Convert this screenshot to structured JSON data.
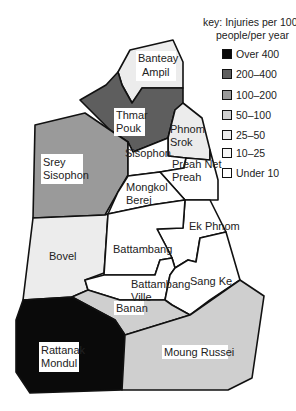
{
  "key": {
    "title_line1": "key: Injuries per 100,000",
    "title_line2": "people/per year",
    "items": [
      {
        "label": "Over 400",
        "color": "#0a0a0a"
      },
      {
        "label": "200–400",
        "color": "#5e5e5e"
      },
      {
        "label": "100–200",
        "color": "#9a9a9a"
      },
      {
        "label": "50–100",
        "color": "#cfcfcf"
      },
      {
        "label": "25–50",
        "color": "#ececec"
      },
      {
        "label": "10–25",
        "color": "#f7f7f7"
      },
      {
        "label": "Under 10",
        "color": "#ffffff"
      }
    ]
  },
  "regions": {
    "banteay_ampil": {
      "line1": "Banteay",
      "line2": "Ampil",
      "category": "25–50"
    },
    "thmar_pouk": {
      "line1": "Thmar",
      "line2": "Pouk",
      "category": "200–400"
    },
    "phnom_srok": {
      "line1": "Phnom",
      "line2": "Srok",
      "category": "25–50"
    },
    "srey_sisophon": {
      "line1": "Srey",
      "line2": "Sisophon",
      "category": "100–200"
    },
    "sisophon": {
      "line1": "Sisophon",
      "category": "Under 10"
    },
    "preah_net_preah": {
      "line1": "Preah Net",
      "line2": "Preah",
      "category": "Under 10"
    },
    "mongkol_berei": {
      "line1": "Mongkol",
      "line2": "Berei",
      "category": "Under 10"
    },
    "ek_phnom": {
      "line1": "Ek Phnom",
      "category": "Under 10"
    },
    "bovel": {
      "line1": "Bovel",
      "category": "25–50"
    },
    "battambang": {
      "line1": "Battambang",
      "category": "Under 10"
    },
    "battambang_ville": {
      "line1": "Battambang",
      "line2": "Ville",
      "category": "Under 10"
    },
    "sang_ke": {
      "line1": "Sang Ke",
      "category": "Under 10"
    },
    "banan": {
      "line1": "Banan",
      "category": "50–100"
    },
    "rattanak_mondul": {
      "line1": "Rattanak",
      "line2": "Mondul",
      "category": "Over 400"
    },
    "moung_russei": {
      "line1": "Moung Russei",
      "category": "50–100"
    }
  }
}
